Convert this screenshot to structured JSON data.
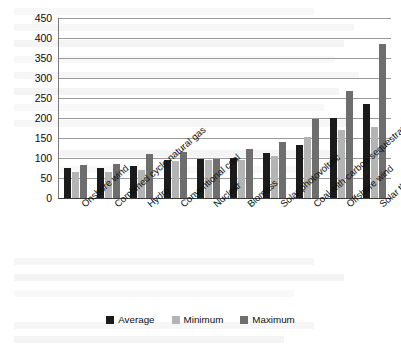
{
  "chart_data": {
    "type": "bar",
    "title": "",
    "xlabel": "",
    "ylabel": "",
    "ylim": [
      0,
      450
    ],
    "yticks": [
      0,
      50,
      100,
      150,
      200,
      250,
      300,
      350,
      400,
      450
    ],
    "grid": true,
    "legend_position": "bottom",
    "categories": [
      "Onshore wind",
      "Combined cycle natural gas",
      "Hydro",
      "Conventional coal",
      "Nuclear",
      "Biomass",
      "Solar photovoltaic",
      "Coal with carbon sequestration",
      "Offshore wind",
      "Solar thermal"
    ],
    "series": [
      {
        "name": "Average",
        "color": "#1b1b1b",
        "values": [
          75,
          74,
          79,
          95,
          97,
          100,
          113,
          132,
          200,
          235
        ]
      },
      {
        "name": "Minimum",
        "color": "#b4b4b4",
        "values": [
          64,
          66,
          69,
          92,
          94,
          94,
          104,
          152,
          170,
          178
        ]
      },
      {
        "name": "Maximum",
        "color": "#6e6e6e",
        "values": [
          83,
          86,
          111,
          116,
          97,
          122,
          139,
          198,
          267,
          385
        ]
      }
    ]
  },
  "legend": {
    "entries": [
      {
        "label": "Average",
        "color": "#1b1b1b"
      },
      {
        "label": "Minimum",
        "color": "#b4b4b4"
      },
      {
        "label": "Maximum",
        "color": "#6e6e6e"
      }
    ]
  }
}
